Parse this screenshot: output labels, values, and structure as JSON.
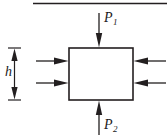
{
  "figure": {
    "type": "free-body-diagram",
    "title": "",
    "background_color": "#ffffff",
    "stroke_color": "#231f20",
    "width": 167,
    "height": 140
  },
  "body": {
    "shape": "rectangle",
    "name": "control-volume",
    "x": 69,
    "y": 48,
    "width": 64,
    "height": 52,
    "fill": "#ffffff",
    "stroke": "#231f20"
  },
  "top_boundary_line": {
    "name": "upper-boundary-line",
    "x1": 33,
    "y1": 3,
    "x2": 167,
    "y2": 3
  },
  "labels": {
    "p1": {
      "base": "P",
      "sub": "1"
    },
    "p2": {
      "base": "P",
      "sub": "2"
    },
    "h": {
      "base": "h",
      "sub": ""
    }
  },
  "arrows": [
    {
      "name": "pressure-arrow-top",
      "label": "P1",
      "direction": "down",
      "x": 99,
      "from_y": 13,
      "to_y": 47
    },
    {
      "name": "pressure-arrow-bottom",
      "label": "P2",
      "direction": "up",
      "x": 99,
      "from_y": 135,
      "to_y": 101
    },
    {
      "name": "side-arrow-left-upper",
      "label": "",
      "direction": "right",
      "y": 61,
      "from_x": 36,
      "to_x": 68
    },
    {
      "name": "side-arrow-left-lower",
      "label": "",
      "direction": "right",
      "y": 83,
      "from_x": 36,
      "to_x": 68
    },
    {
      "name": "side-arrow-right-upper",
      "label": "",
      "direction": "left",
      "y": 61,
      "from_x": 166,
      "to_x": 134
    },
    {
      "name": "side-arrow-right-lower",
      "label": "",
      "direction": "left",
      "y": 83,
      "from_x": 166,
      "to_x": 134
    }
  ],
  "dimension": {
    "name": "height-dimension",
    "label": "h",
    "orientation": "vertical",
    "x": 14,
    "top_y": 48,
    "bottom_y": 100,
    "tick_half_width": 6
  }
}
